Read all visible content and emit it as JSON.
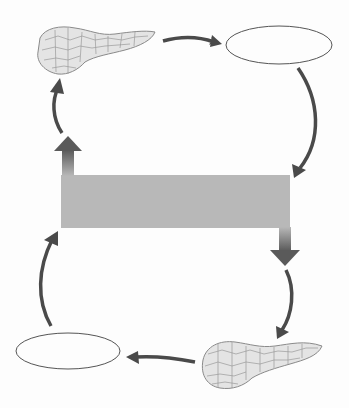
{
  "diagram": {
    "type": "feedback-loop",
    "colors": {
      "background": "#fdfdfd",
      "arrow": "#4a4a4a",
      "bar": "#b8b8b8",
      "ellipse_stroke": "#555555",
      "pancreas_fill": "#e4e4e4",
      "pancreas_stroke": "#8a8a8a"
    },
    "nodes": [
      {
        "id": "pancreas-top",
        "kind": "organ-illustration",
        "label": ""
      },
      {
        "id": "label-top-right",
        "kind": "blank-ellipse",
        "label": ""
      },
      {
        "id": "center-bar",
        "kind": "blank-bar",
        "label": ""
      },
      {
        "id": "pancreas-bottom",
        "kind": "organ-illustration",
        "label": ""
      },
      {
        "id": "label-bottom-left",
        "kind": "blank-ellipse",
        "label": ""
      }
    ],
    "arrows": [
      {
        "from": "pancreas-top",
        "to": "label-top-right"
      },
      {
        "from": "label-top-right",
        "to": "center-bar"
      },
      {
        "from": "center-bar",
        "to": "pancreas-bottom",
        "style": "thick-block"
      },
      {
        "from": "pancreas-bottom",
        "to": "label-bottom-left"
      },
      {
        "from": "label-bottom-left",
        "to": "center-bar"
      },
      {
        "from": "center-bar",
        "to": "pancreas-top",
        "style": "thick-block"
      }
    ]
  }
}
